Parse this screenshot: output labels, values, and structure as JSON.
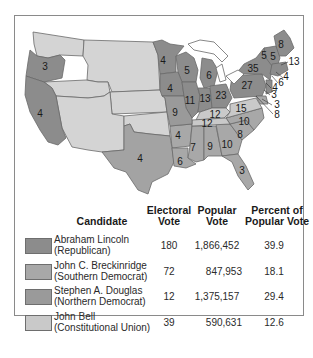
{
  "colors": {
    "lincoln": "#8c8c8c",
    "breckinridge": "#a8a8a8",
    "douglas": "#9a9a9a",
    "bell": "#c9c9c9",
    "territory": "#d9d9d9",
    "border": "#6a6a6a",
    "lakes": "#ffffff"
  },
  "map": {
    "state_labels": [
      {
        "state": "Oregon",
        "votes": "3"
      },
      {
        "state": "California",
        "votes": "4"
      },
      {
        "state": "Minnesota",
        "votes": "4"
      },
      {
        "state": "Wisconsin",
        "votes": "5"
      },
      {
        "state": "Michigan",
        "votes": "6"
      },
      {
        "state": "Iowa",
        "votes": "4"
      },
      {
        "state": "Illinois",
        "votes": "11"
      },
      {
        "state": "Indiana",
        "votes": "13"
      },
      {
        "state": "Ohio",
        "votes": "23"
      },
      {
        "state": "Pennsylvania",
        "votes": "27"
      },
      {
        "state": "New York",
        "votes": "35"
      },
      {
        "state": "Maine",
        "votes": "8"
      },
      {
        "state": "Vermont",
        "votes": "5"
      },
      {
        "state": "New Hampshire",
        "votes": "5"
      },
      {
        "state": "Massachusetts",
        "votes": "13"
      },
      {
        "state": "Rhode Island",
        "votes": "4"
      },
      {
        "state": "Connecticut",
        "votes": "6"
      },
      {
        "state": "New Jersey",
        "votes": "4"
      },
      {
        "state": "Delaware",
        "votes": "3"
      },
      {
        "state": "Maryland",
        "votes": "8"
      },
      {
        "state": "Missouri",
        "votes": "9"
      },
      {
        "state": "Kentucky",
        "votes": "12"
      },
      {
        "state": "Virginia",
        "votes": "15"
      },
      {
        "state": "Tennessee",
        "votes": "12"
      },
      {
        "state": "North Carolina",
        "votes": "10"
      },
      {
        "state": "South Carolina",
        "votes": "8"
      },
      {
        "state": "Arkansas",
        "votes": "4"
      },
      {
        "state": "Mississippi",
        "votes": "7"
      },
      {
        "state": "Alabama",
        "votes": "9"
      },
      {
        "state": "Georgia",
        "votes": "10"
      },
      {
        "state": "Louisiana",
        "votes": "6"
      },
      {
        "state": "Texas",
        "votes": "4"
      },
      {
        "state": "Florida",
        "votes": "3"
      },
      {
        "state": "Dist-3",
        "votes": "3"
      }
    ]
  },
  "table": {
    "headers": {
      "candidate": "Candidate",
      "electoral_1": "Electoral",
      "electoral_2": "Vote",
      "popular_1": "Popular",
      "popular_2": "Vote",
      "percent_1": "Percent of",
      "percent_2": "Popular Vote"
    },
    "rows": [
      {
        "name": "Abraham Lincoln",
        "party": "(Republican)",
        "electoral": "180",
        "popular": "1,866,452",
        "percent": "39.9",
        "color": "#8c8c8c"
      },
      {
        "name": "John C. Breckinridge",
        "party": "(Southern Democrat)",
        "electoral": "72",
        "popular": "847,953",
        "percent": "18.1",
        "color": "#a8a8a8"
      },
      {
        "name": "Stephen A. Douglas",
        "party": "(Northern Democrat)",
        "electoral": "12",
        "popular": "1,375,157",
        "percent": "29.4",
        "color": "#9a9a9a"
      },
      {
        "name": "John Bell",
        "party": "(Constitutional Union)",
        "electoral": "39",
        "popular": "590,631",
        "percent": "12.6",
        "color": "#c9c9c9"
      }
    ]
  }
}
